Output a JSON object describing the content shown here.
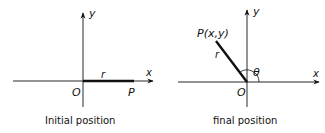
{
  "figures": [
    {
      "id": "initial",
      "caption": "Initial position",
      "labels": {
        "y_axis": "y",
        "x_axis": "x",
        "origin": "O",
        "radius": "r",
        "point": "P"
      }
    },
    {
      "id": "final",
      "caption": "final position",
      "labels": {
        "y_axis": "y",
        "x_axis": "x",
        "origin": "O",
        "radius": "r",
        "point": "P(x,y)",
        "angle": "θ"
      }
    }
  ],
  "colors": {
    "ink": "#111111",
    "background": "#ffffff"
  }
}
